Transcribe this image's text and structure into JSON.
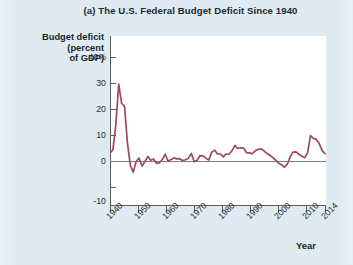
{
  "chart_data": {
    "type": "line",
    "title": "(a) The U.S. Federal Budget Deficit Since 1940",
    "ylabel": "Budget deficit\n(percent\nof GDP)",
    "ylabel_lines": [
      "Budget deficit",
      "(percent",
      "of GDP)"
    ],
    "xlabel": "Year",
    "ylim": [
      -10,
      40
    ],
    "xlim": [
      1940,
      2014
    ],
    "yticks": [
      40,
      30,
      20,
      10,
      0,
      -10
    ],
    "ytick_labels": [
      "40%",
      "30",
      "20",
      "10",
      "0",
      "-10"
    ],
    "xticks": [
      1940,
      1950,
      1960,
      1970,
      1980,
      1990,
      2000,
      2010,
      2014
    ],
    "xtick_labels": [
      "1940",
      "1950",
      "1960",
      "1970",
      "1980",
      "1990",
      "2000",
      "2010",
      "2014"
    ],
    "grid": false,
    "legend": null,
    "line_color": "#9d4a5c",
    "zero_line_color": "#7d7d7d",
    "axis_color": "#5d5d5d",
    "plot_bg": "#ffffff",
    "page_bg": "#dfeaf1",
    "series": [
      {
        "name": "Federal budget deficit (percent of GDP)",
        "x": [
          1940,
          1941,
          1942,
          1943,
          1944,
          1945,
          1946,
          1947,
          1948,
          1949,
          1950,
          1951,
          1952,
          1953,
          1954,
          1955,
          1956,
          1957,
          1958,
          1959,
          1960,
          1961,
          1962,
          1963,
          1964,
          1965,
          1966,
          1967,
          1968,
          1969,
          1970,
          1971,
          1972,
          1973,
          1974,
          1975,
          1976,
          1977,
          1978,
          1979,
          1980,
          1981,
          1982,
          1983,
          1984,
          1985,
          1986,
          1987,
          1988,
          1989,
          1990,
          1991,
          1992,
          1993,
          1994,
          1995,
          1996,
          1997,
          1998,
          1999,
          2000,
          2001,
          2002,
          2003,
          2004,
          2005,
          2006,
          2007,
          2008,
          2009,
          2010,
          2011,
          2012,
          2013,
          2014
        ],
        "values": [
          3.0,
          4.3,
          13.9,
          29.6,
          22.2,
          21.0,
          7.0,
          -1.7,
          -4.3,
          -0.2,
          1.1,
          -1.9,
          -0.3,
          1.7,
          0.3,
          0.8,
          -0.9,
          -0.7,
          0.6,
          2.6,
          -0.1,
          0.6,
          1.2,
          0.8,
          0.9,
          0.2,
          0.5,
          1.1,
          2.9,
          -0.3,
          0.3,
          2.1,
          2.0,
          1.1,
          0.4,
          3.4,
          4.2,
          2.7,
          2.7,
          1.6,
          2.7,
          2.6,
          4.0,
          6.0,
          4.8,
          5.1,
          5.0,
          3.2,
          3.1,
          2.8,
          3.9,
          4.5,
          4.7,
          3.9,
          2.9,
          2.2,
          1.4,
          0.3,
          -0.8,
          -1.4,
          -2.4,
          -1.3,
          1.5,
          3.4,
          3.5,
          2.6,
          1.9,
          1.2,
          3.1,
          9.8,
          8.7,
          8.4,
          6.7,
          4.1,
          2.8
        ],
        "peak_year": 1943,
        "peak_value": 29.6,
        "recent_peak_year": 2009,
        "recent_peak_value": 9.8,
        "last_value": 2.8
      }
    ]
  },
  "figure": {
    "title": "(a) The U.S. Federal Budget Deficit Since 1940",
    "y_axis_title_lines": [
      "Budget deficit",
      "(percent",
      "of GDP)"
    ],
    "x_axis_title": "Year"
  }
}
